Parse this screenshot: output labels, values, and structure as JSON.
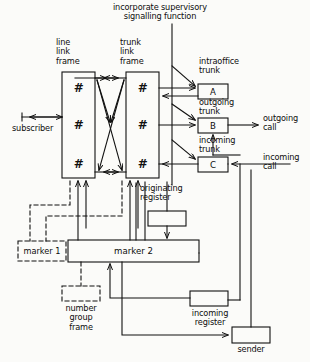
{
  "diagram": {
    "title_note": "incorporate supervisory\nsignalling function",
    "background": "#fbfbf9",
    "line_color": "#111111",
    "blocks": [
      {
        "id": "line-link-frame",
        "label": "line\nlink\nframe",
        "box_label": "",
        "x": 62,
        "y": 72,
        "w": 33,
        "h": 106,
        "style": "solid",
        "cells": [
          "#",
          "#",
          "#"
        ]
      },
      {
        "id": "trunk-link-frame",
        "label": "trunk\nlink\nframe",
        "box_label": "",
        "x": 126,
        "y": 72,
        "w": 33,
        "h": 106,
        "style": "solid",
        "cells": [
          "#",
          "#",
          "#"
        ]
      },
      {
        "id": "intraoffice-trunk",
        "label": "intraoffice\ntrunk",
        "box_label": "A",
        "x": 198,
        "y": 84,
        "w": 30,
        "h": 15,
        "style": "solid"
      },
      {
        "id": "outgoing-trunk",
        "label": "outgoing\ntrunk",
        "box_label": "B",
        "x": 198,
        "y": 118,
        "w": 30,
        "h": 15,
        "style": "solid"
      },
      {
        "id": "incoming-trunk",
        "label": "incoming\ntrunk",
        "box_label": "C",
        "x": 198,
        "y": 157,
        "w": 30,
        "h": 15,
        "style": "solid"
      },
      {
        "id": "originating-register",
        "label": "originating\nregister",
        "box_label": "",
        "x": 148,
        "y": 211,
        "w": 38,
        "h": 15,
        "style": "solid"
      },
      {
        "id": "marker-2",
        "label": "",
        "box_label": "marker 2",
        "x": 68,
        "y": 240,
        "w": 131,
        "h": 22,
        "style": "solid"
      },
      {
        "id": "marker-1",
        "label": "",
        "box_label": "marker 1",
        "x": 18,
        "y": 241,
        "w": 48,
        "h": 20,
        "style": "dashed"
      },
      {
        "id": "number-group-frame",
        "label": "number\ngroup\nframe",
        "box_label": "",
        "x": 62,
        "y": 286,
        "w": 38,
        "h": 15,
        "style": "dashed"
      },
      {
        "id": "incoming-register",
        "label": "incoming\nregister",
        "box_label": "",
        "x": 190,
        "y": 291,
        "w": 38,
        "h": 15,
        "style": "solid"
      },
      {
        "id": "sender",
        "label": "sender",
        "box_label": "",
        "x": 232,
        "y": 327,
        "w": 38,
        "h": 16,
        "style": "solid"
      }
    ],
    "edge_labels": [
      {
        "id": "subscriber",
        "text": "subscriber",
        "x": 15,
        "y": 128
      },
      {
        "id": "outgoing-call",
        "text": "outgoing\ncall",
        "x": 264,
        "y": 116
      },
      {
        "id": "incoming-call",
        "text": "incoming\ncall",
        "x": 264,
        "y": 155
      }
    ]
  }
}
